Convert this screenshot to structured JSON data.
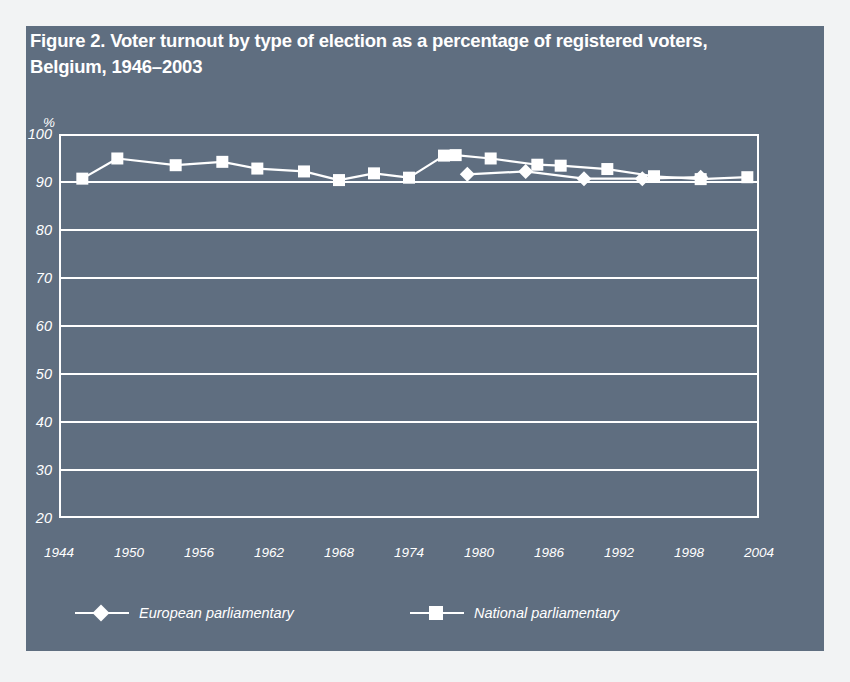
{
  "figure": {
    "title": "Figure 2. Voter turnout by type of election as a percentage of registered voters, Belgium, 1946–2003",
    "panel_color": "#5f6e80",
    "ink_color": "#ffffff",
    "page_background": "#f2f3f4"
  },
  "chart_data": {
    "type": "line",
    "title": "Figure 2. Voter turnout by type of election as a percentage of registered voters, Belgium, 1946–2003",
    "xlabel": "",
    "ylabel": "%",
    "y_unit_label": "%",
    "xlim": [
      1944,
      2004
    ],
    "ylim": [
      20,
      100
    ],
    "y_ticks": [
      100,
      90,
      80,
      70,
      60,
      50,
      40,
      30,
      20
    ],
    "y_tick_labels": [
      "100",
      "90",
      "80",
      "70",
      "60",
      "50",
      "40",
      "30",
      "20"
    ],
    "x_ticks": [
      1944,
      1950,
      1956,
      1962,
      1968,
      1974,
      1980,
      1986,
      1992,
      1998,
      2004
    ],
    "x_tick_labels": [
      "1944",
      "1950",
      "1956",
      "1962",
      "1968",
      "1974",
      "1980",
      "1986",
      "1992",
      "1998",
      "2004"
    ],
    "grid": true,
    "grid_axis": "y",
    "legend_position": "bottom",
    "series": [
      {
        "name": "European parliamentary",
        "marker": "diamond",
        "color": "#ffffff",
        "x": [
          1979,
          1984,
          1989,
          1994,
          1999
        ],
        "values": [
          91.6,
          92.2,
          90.7,
          90.7,
          91.0
        ]
      },
      {
        "name": "National parliamentary",
        "marker": "square",
        "color": "#ffffff",
        "x": [
          1946,
          1949,
          1954,
          1958,
          1961,
          1965,
          1968,
          1971,
          1974,
          1977,
          1978,
          1981,
          1985,
          1987,
          1991,
          1995,
          1999,
          2003
        ],
        "values": [
          90.7,
          94.9,
          93.5,
          94.2,
          92.8,
          92.2,
          90.4,
          91.8,
          90.9,
          95.5,
          95.6,
          94.9,
          93.6,
          93.4,
          92.7,
          91.2,
          90.6,
          91.0
        ]
      }
    ]
  },
  "legend": {
    "entries": [
      {
        "label": "European parliamentary",
        "marker": "diamond"
      },
      {
        "label": "National parliamentary",
        "marker": "square"
      }
    ]
  }
}
